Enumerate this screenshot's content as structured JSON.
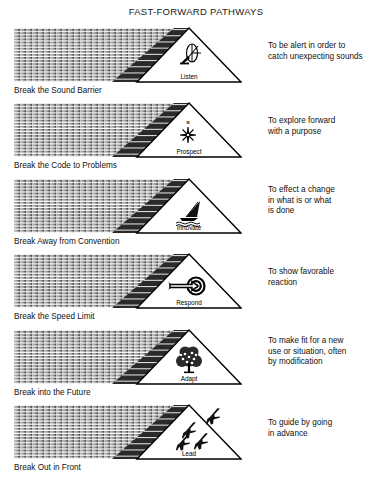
{
  "title": "FAST-FORWARD PATHWAYS",
  "rows": [
    {
      "icon": "satellite-dish-icon",
      "triangle_label": "Listen",
      "arrow_caption": "Break the Sound Barrier",
      "description": "To be alert in order to catch unexpecting sounds",
      "description_lines": [
        "To be alert in order to",
        "catch unexpecting sounds"
      ]
    },
    {
      "icon": "compass-rose-icon",
      "triangle_label": "Prospect",
      "arrow_caption": "Break the Code to Problems",
      "description": "To explore forward with a purpose",
      "description_lines": [
        "To explore forward",
        "with a purpose"
      ]
    },
    {
      "icon": "windsurfer-icon",
      "triangle_label": "Innovate",
      "arrow_caption": "Break Away from Convention",
      "description": "To effect a change in what is or what is done",
      "description_lines": [
        "To effect a change",
        "in what is or what",
        "is done"
      ]
    },
    {
      "icon": "arrow-target-icon",
      "triangle_label": "Respond",
      "arrow_caption": "Break the Speed Limit",
      "description": "To show favorable reaction",
      "description_lines": [
        "To show favorable",
        "reaction"
      ]
    },
    {
      "icon": "tree-icon",
      "triangle_label": "Adapt",
      "arrow_caption": "Break into the Future",
      "description": "To make fit for a new use or situation, often by modification",
      "description_lines": [
        "To make fit for a new",
        "use or situation, often",
        "by modification"
      ]
    },
    {
      "icon": "jet-formation-icon",
      "triangle_label": "Lead",
      "arrow_caption": "Break Out in Front",
      "description": "To guide by going in advance",
      "description_lines": [
        "To guide by going",
        "in advance"
      ]
    }
  ],
  "compass_north_label": "N",
  "colors": {
    "ink": "#000000",
    "background": "#ffffff",
    "stripe_light": "#b9b9b9",
    "stripe_dark": "#4a4a4a",
    "wedge": "#1c1c1c"
  }
}
